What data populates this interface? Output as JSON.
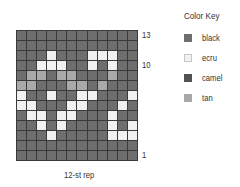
{
  "chart_data": {
    "type": "table",
    "caption": "12-st rep",
    "columns": 12,
    "rows": 13,
    "row_labels": [
      {
        "label": "13",
        "row": 13
      },
      {
        "label": "10",
        "row": 10
      },
      {
        "label": "1",
        "row": 1
      }
    ],
    "legend": [
      {
        "code": "B",
        "name": "black",
        "color": "#6e6e6e"
      },
      {
        "code": "E",
        "name": "ecru",
        "color": "#f1f1f1"
      },
      {
        "code": "C",
        "name": "camel",
        "color": "#525252"
      },
      {
        "code": "T",
        "name": "tan",
        "color": "#a9a9a9"
      }
    ],
    "grid_top_to_bottom": [
      "BBBBBBBBBBBB",
      "BBBBBBBBBBBB",
      "BBBEBBBEEEBB",
      "BBEEEBBEBEBB",
      "BTTBTTBBBTBB",
      "TTBBBTTBTBBB",
      "EBBEBBEEBBBE",
      "EEBBBEEBBBEB",
      "BEEBEEBBBEBB",
      "BBEBEBBBBEBE",
      "BBBEBBBBBEEE",
      "BBBBBBBBBBBB",
      "BBBBBBBBBBBB"
    ]
  },
  "key": {
    "title": "Color Key",
    "items": [
      {
        "label": "black",
        "code": "B"
      },
      {
        "label": "ecru",
        "code": "E"
      },
      {
        "label": "camel",
        "code": "C"
      },
      {
        "label": "tan",
        "code": "T"
      }
    ]
  },
  "row_numbers": {
    "top": "13",
    "mid": "10",
    "bottom": "1"
  },
  "caption": "12-st rep"
}
